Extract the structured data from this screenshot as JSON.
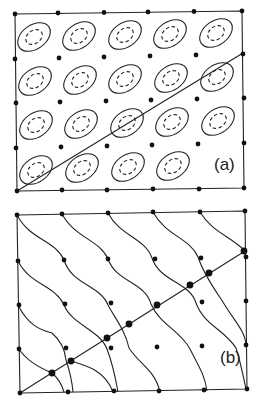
{
  "figure": {
    "panels": [
      {
        "id": "a",
        "label": "(a)",
        "description": "Lattice of sites with elliptical orbitals (solid outer, dashed inner) and a diagonal line"
      },
      {
        "id": "b",
        "label": "(b)",
        "description": "Distorted lattice with wavy lines connecting sites and a diagonal line of enlarged dots"
      }
    ],
    "colors": {
      "ink": "#222222",
      "background": "#ffffff"
    }
  }
}
